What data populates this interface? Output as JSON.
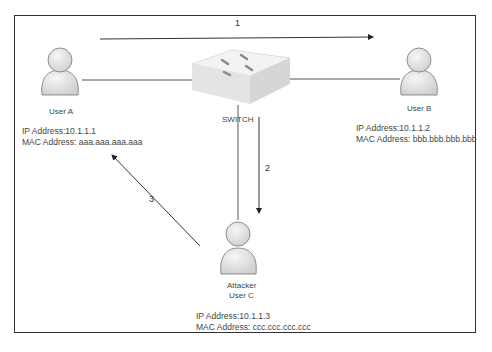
{
  "diagram": {
    "switch": {
      "label": "SWITCH"
    },
    "nodes": [
      {
        "id": "user-a",
        "name": "User A",
        "ip_label": "IP Address:10.1.1.1",
        "mac_label": "MAC Address: aaa.aaa.aaa.aaa"
      },
      {
        "id": "user-b",
        "name": "User B",
        "ip_label": "IP Address:10.1.1.2",
        "mac_label": "MAC Address: bbb.bbb.bbb.bbb"
      },
      {
        "id": "user-c",
        "name_line1": "Attacker",
        "name_line2": "User C",
        "ip_label": "IP Address:10.1.1.3",
        "mac_label": "MAC Address: ccc.ccc.ccc.ccc"
      }
    ],
    "steps": [
      {
        "number": "1",
        "from": "User A",
        "to": "User B"
      },
      {
        "number": "2",
        "from": "Switch",
        "to": "User C"
      },
      {
        "number": "3",
        "from": "User C",
        "to": "User A"
      }
    ],
    "colors": {
      "line": "#444444",
      "person_fill": "#e6e6e6",
      "person_stroke": "#777777",
      "switch_top": "#f2f2f2",
      "switch_side": "#d8d8d8"
    }
  }
}
